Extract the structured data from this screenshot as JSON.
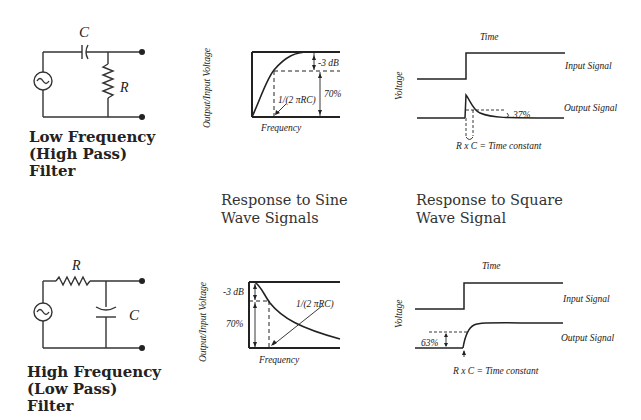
{
  "high_pass": {
    "circuit": {
      "capacitor_label": "C",
      "resistor_label": "R"
    },
    "title_lines": [
      "Low Frequency",
      "(High Pass)",
      "Filter"
    ],
    "sine_response": {
      "ylabel": "Output/Input Voltage",
      "xlabel": "Frequency",
      "db_label": "-3 dB",
      "pct_label": "70%",
      "cutoff_label": "1/(2 πRC)"
    },
    "square_response": {
      "time_label": "Time",
      "ylabel": "Voltage",
      "input_label": "Input Signal",
      "output_label": "Output Signal",
      "pct_label": "37%",
      "tc_label": "R x C = Time constant"
    }
  },
  "low_pass": {
    "circuit": {
      "capacitor_label": "C",
      "resistor_label": "R"
    },
    "title_lines": [
      "High Frequency",
      "(Low Pass)",
      "Filter"
    ],
    "sine_response": {
      "ylabel": "Output/Input Voltage",
      "xlabel": "Frequency",
      "db_label": "-3 dB",
      "pct_label": "70%",
      "cutoff_label": "1/(2 πRC)"
    },
    "square_response": {
      "time_label": "Time",
      "ylabel": "Voltage",
      "input_label": "Input Signal",
      "output_label": "Output Signal",
      "pct_label": "63%",
      "tc_label": "R x C = Time constant"
    }
  },
  "captions": {
    "sine": [
      "Response to Sine",
      "Wave Signals"
    ],
    "square": [
      "Response to Square",
      "Wave Signal"
    ]
  }
}
